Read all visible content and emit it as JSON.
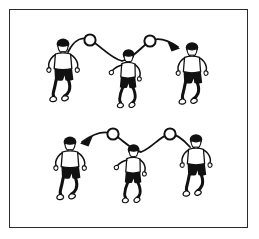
{
  "figure": {
    "kind": "sports-drill-illustration",
    "sport": "soccer",
    "title": "Soccer heading drill — two rows of three players with ball trajectory arcs",
    "canvas": {
      "width": 259,
      "height": 239
    },
    "colors": {
      "background": "#ffffff",
      "border": "#2c2c2c",
      "ink": "#111111",
      "shirt": "#ffffff",
      "shorts": "#111111",
      "hair": "#111111",
      "skin": "#ffffff"
    },
    "frame": {
      "x": 9,
      "y": 9,
      "width": 239,
      "height": 219,
      "stroke_width": 1.6
    }
  },
  "rows": [
    {
      "id": "top-row",
      "label": "Top row",
      "direction": "left-to-right",
      "players": [
        {
          "id": "top-left-player",
          "label": "Player 1",
          "pose": "standing-arms-out",
          "facing": "front",
          "x": 63,
          "y": 52,
          "scale": 1.0
        },
        {
          "id": "top-middle-player",
          "label": "Player 2",
          "pose": "twisting-arm-raised",
          "facing": "three-quarter",
          "x": 128,
          "y": 60,
          "scale": 0.95
        },
        {
          "id": "top-right-player",
          "label": "Player 3",
          "pose": "standing-arms-out",
          "facing": "front",
          "x": 192,
          "y": 55,
          "scale": 0.98
        }
      ],
      "balls": [
        {
          "id": "top-ball-1",
          "label": "Ball",
          "cx": 90,
          "cy": 40,
          "r": 5.6
        },
        {
          "id": "top-ball-2",
          "label": "Ball",
          "cx": 150,
          "cy": 41,
          "r": 5.6
        }
      ],
      "path": {
        "id": "top-trajectory",
        "label": "Ball trajectory arc",
        "d": "M 68 52 C 74 40, 82 36, 90 40 C 100 45, 110 58, 122 61 C 134 58, 142 46, 150 41 C 158 37, 168 40, 178 47",
        "stroke_width": 1.8
      },
      "arrow": {
        "id": "top-arrowhead",
        "label": "Direction arrowhead",
        "points": "178,47 168,41 172,50",
        "direction": "right"
      }
    },
    {
      "id": "bottom-row",
      "label": "Bottom row",
      "direction": "right-to-left",
      "players": [
        {
          "id": "bottom-left-player",
          "label": "Player 4",
          "pose": "standing-arms-out",
          "facing": "front",
          "x": 70,
          "y": 150,
          "scale": 1.0
        },
        {
          "id": "bottom-middle-player",
          "label": "Player 5",
          "pose": "twisting-arm-raised",
          "facing": "three-quarter",
          "x": 133,
          "y": 155,
          "scale": 0.95
        },
        {
          "id": "bottom-right-player",
          "label": "Player 6",
          "pose": "standing-arms-out",
          "facing": "front",
          "x": 196,
          "y": 147,
          "scale": 0.98
        }
      ],
      "balls": [
        {
          "id": "bottom-ball-1",
          "label": "Ball",
          "cx": 113,
          "cy": 134,
          "r": 5.6
        },
        {
          "id": "bottom-ball-2",
          "label": "Ball",
          "cx": 170,
          "cy": 134,
          "r": 5.6
        }
      ],
      "path": {
        "id": "bottom-trajectory",
        "label": "Ball trajectory arc",
        "d": "M 190 147 C 183 139, 177 134, 170 134 C 161 135, 152 148, 141 152 C 131 150, 122 139, 113 134 C 104 130, 93 134, 82 142",
        "stroke_width": 1.8
      },
      "arrow": {
        "id": "bottom-arrowhead",
        "label": "Direction arrowhead",
        "points": "82,142 92,137 88,146",
        "direction": "left"
      }
    }
  ]
}
